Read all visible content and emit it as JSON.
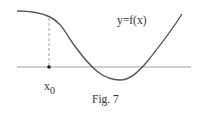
{
  "figure": {
    "caption": "Fig. 7",
    "curve_label": "y=f(x)",
    "point_label_base": "x",
    "point_label_sub": "0",
    "colors": {
      "curve": "#555555",
      "axis": "#999999",
      "dashed": "#999999",
      "text": "#333333"
    }
  }
}
